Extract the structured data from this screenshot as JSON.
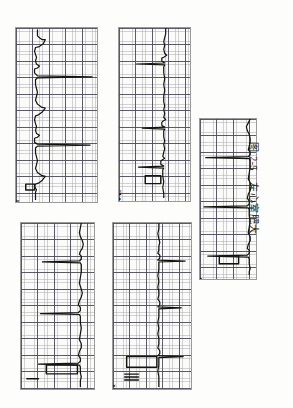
{
  "figure": {
    "caption_prefix": "图",
    "caption_number": "2-5",
    "caption_title": "左心室肥大",
    "caption_full": "图 2-5  左心室肥大",
    "page_background": "#fdfdfc",
    "grid_fine_color": "#696973",
    "grid_bold_color": "#464655",
    "trace_color": "#14140f",
    "orientation_note": "scanned page rotated 90 degrees"
  },
  "panels": [
    {
      "id": "panel-v1",
      "lead": "V",
      "lead_sub": "1",
      "lead_full": "V1",
      "position": "top-left",
      "grid_squares_small": "1 mm",
      "grid_squares_large": "5 mm"
    },
    {
      "id": "panel-avl",
      "lead": "aVL",
      "lead_sub": "",
      "lead_full": "aVL",
      "position": "top-middle",
      "grid_squares_small": "1 mm",
      "grid_squares_large": "5 mm"
    },
    {
      "id": "panel-v5",
      "lead": "V",
      "lead_sub": "5",
      "lead_full": "V5",
      "position": "right",
      "grid_squares_small": "1 mm",
      "grid_squares_large": "5 mm"
    },
    {
      "id": "panel-i",
      "lead": "I",
      "lead_sub": "",
      "lead_full": "I",
      "position": "bottom-left",
      "grid_squares_small": "1 mm",
      "grid_squares_large": "5 mm"
    },
    {
      "id": "panel-iii",
      "lead": "III",
      "lead_sub": "",
      "lead_full": "III",
      "position": "bottom-middle",
      "grid_squares_small": "1 mm",
      "grid_squares_large": "5 mm"
    }
  ]
}
